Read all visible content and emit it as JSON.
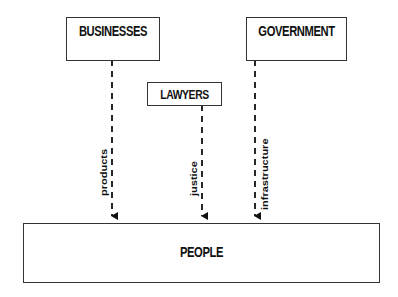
{
  "diagram": {
    "nodes": [
      {
        "id": "businesses",
        "label": "BUSINESSES"
      },
      {
        "id": "government",
        "label": "GOVERNMENT"
      },
      {
        "id": "lawyers",
        "label": "LAWYERS"
      },
      {
        "id": "people",
        "label": "PEOPLE"
      }
    ],
    "edges": [
      {
        "from": "businesses",
        "to": "people",
        "label": "products",
        "style": "dashed"
      },
      {
        "from": "lawyers",
        "to": "people",
        "label": "justice",
        "style": "dashed"
      },
      {
        "from": "government",
        "to": "people",
        "label": "infrastructure",
        "style": "dashed"
      }
    ]
  }
}
